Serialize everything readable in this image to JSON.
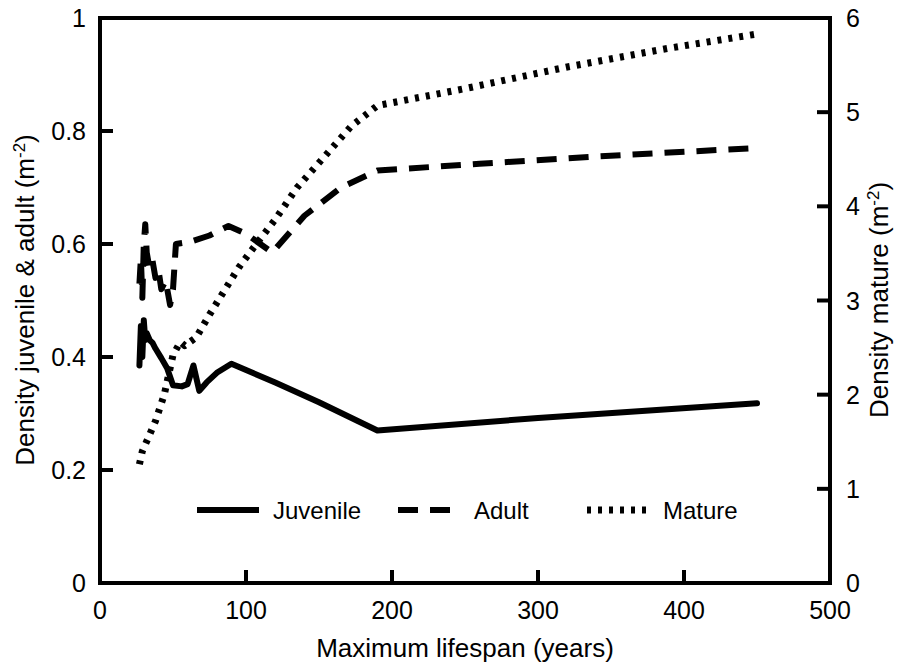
{
  "chart_data": {
    "type": "line",
    "title": "",
    "xlabel": "Maximum lifespan (years)",
    "ylabel": "Density juvenile & adult (m-2)",
    "ylabel_base": "Density juvenile & adult (m",
    "ylabel_sup": "-2",
    "ylabel_tail": ")",
    "y2label": "Density mature (m-2)",
    "y2label_base": "Density mature (m",
    "y2label_sup": "-2",
    "y2label_tail": ")",
    "xlim": [
      0,
      500
    ],
    "ylim": [
      0,
      1
    ],
    "y2lim": [
      0,
      6
    ],
    "xticks": [
      0,
      100,
      200,
      300,
      400,
      500
    ],
    "xtick_labels": [
      "0",
      "100",
      "200",
      "300",
      "400",
      "500"
    ],
    "yticks": [
      0,
      0.2,
      0.4,
      0.6,
      0.8,
      1
    ],
    "ytick_labels": [
      "0",
      "0.2",
      "0.4",
      "0.6",
      "0.8",
      "1"
    ],
    "y2ticks": [
      0,
      1,
      2,
      3,
      4,
      5,
      6
    ],
    "y2tick_labels": [
      "0",
      "1",
      "2",
      "3",
      "4",
      "5",
      "6"
    ],
    "grid": false,
    "legend_position": "inside-bottom-center",
    "series": [
      {
        "name": "Juvenile",
        "axis": "left",
        "style": "solid",
        "points": [
          [
            27,
            0.385
          ],
          [
            28,
            0.455
          ],
          [
            29,
            0.4
          ],
          [
            30,
            0.465
          ],
          [
            31,
            0.43
          ],
          [
            32,
            0.442
          ],
          [
            34,
            0.43
          ],
          [
            36,
            0.425
          ],
          [
            38,
            0.415
          ],
          [
            42,
            0.398
          ],
          [
            46,
            0.38
          ],
          [
            50,
            0.35
          ],
          [
            56,
            0.348
          ],
          [
            60,
            0.352
          ],
          [
            64,
            0.385
          ],
          [
            68,
            0.34
          ],
          [
            73,
            0.355
          ],
          [
            80,
            0.372
          ],
          [
            90,
            0.388
          ],
          [
            120,
            0.355
          ],
          [
            150,
            0.32
          ],
          [
            190,
            0.27
          ],
          [
            300,
            0.292
          ],
          [
            450,
            0.318
          ]
        ]
      },
      {
        "name": "Adult",
        "axis": "left",
        "style": "dashed",
        "points": [
          [
            27,
            0.53
          ],
          [
            28,
            0.575
          ],
          [
            29,
            0.505
          ],
          [
            30,
            0.6
          ],
          [
            31,
            0.635
          ],
          [
            32,
            0.585
          ],
          [
            34,
            0.556
          ],
          [
            36,
            0.57
          ],
          [
            38,
            0.54
          ],
          [
            40,
            0.555
          ],
          [
            42,
            0.52
          ],
          [
            45,
            0.535
          ],
          [
            48,
            0.492
          ],
          [
            50,
            0.52
          ],
          [
            52,
            0.6
          ],
          [
            62,
            0.604
          ],
          [
            75,
            0.615
          ],
          [
            88,
            0.632
          ],
          [
            100,
            0.618
          ],
          [
            118,
            0.585
          ],
          [
            140,
            0.65
          ],
          [
            165,
            0.7
          ],
          [
            190,
            0.73
          ],
          [
            260,
            0.742
          ],
          [
            340,
            0.755
          ],
          [
            450,
            0.77
          ]
        ]
      },
      {
        "name": "Mature",
        "axis": "right",
        "style": "dotted",
        "points": [
          [
            27,
            1.26
          ],
          [
            29,
            1.4
          ],
          [
            33,
            1.54
          ],
          [
            38,
            1.72
          ],
          [
            44,
            2.0
          ],
          [
            50,
            2.42
          ],
          [
            55,
            2.56
          ],
          [
            58,
            2.52
          ],
          [
            66,
            2.61
          ],
          [
            75,
            2.85
          ],
          [
            85,
            3.1
          ],
          [
            95,
            3.35
          ],
          [
            108,
            3.62
          ],
          [
            120,
            3.86
          ],
          [
            135,
            4.2
          ],
          [
            155,
            4.55
          ],
          [
            172,
            4.85
          ],
          [
            190,
            5.07
          ],
          [
            250,
            5.25
          ],
          [
            320,
            5.48
          ],
          [
            390,
            5.68
          ],
          [
            450,
            5.83
          ]
        ]
      }
    ],
    "legend": [
      {
        "label": "Juvenile",
        "style": "solid"
      },
      {
        "label": "Adult",
        "style": "dashed"
      },
      {
        "label": "Mature",
        "style": "dotted"
      }
    ]
  }
}
